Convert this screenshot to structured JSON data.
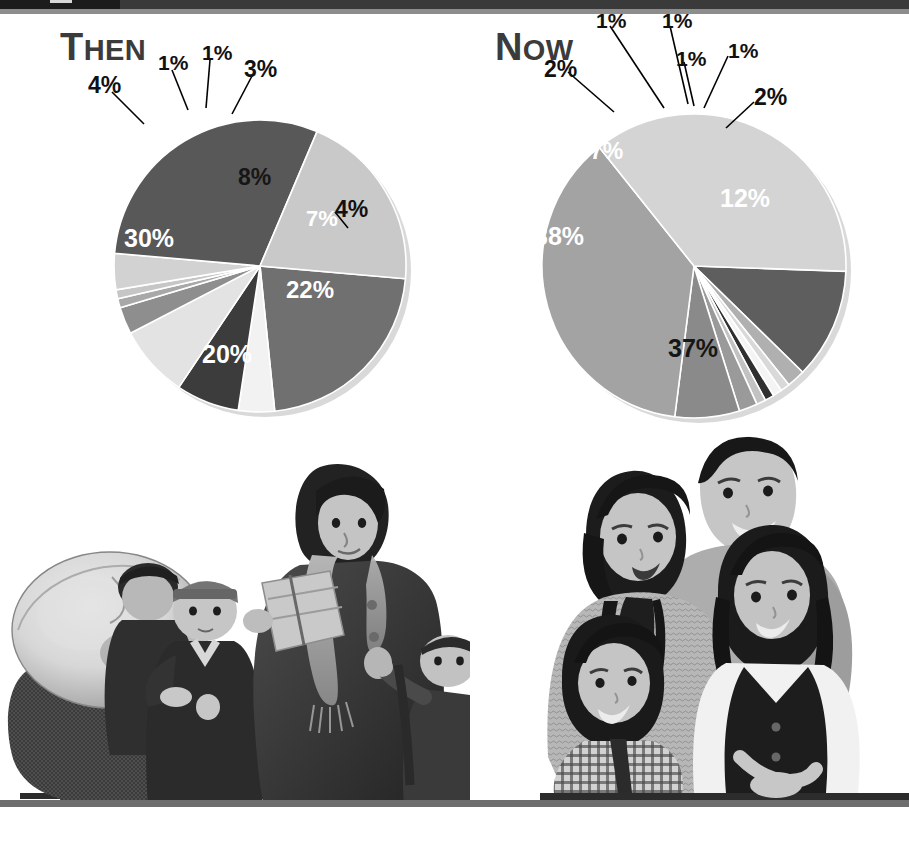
{
  "header": {
    "bar_color": "#3a3a3a",
    "tab_color": "#1c1c1c",
    "rule_color": "#8d8d8d"
  },
  "charts": [
    {
      "id": "then",
      "title_initial": "T",
      "title_rest": "HEN",
      "title_full": "Then"
    },
    {
      "id": "now",
      "title_initial": "N",
      "title_rest": "OW",
      "title_full": "Now"
    }
  ],
  "photos": {
    "left_caption": "historical-immigrant-family-photo",
    "right_caption": "modern-family-photo"
  },
  "chart_data": [
    {
      "type": "pie",
      "title": "Then",
      "id": "then",
      "categories": [
        "22%",
        "4%",
        "7%",
        "8%",
        "3%",
        "1%",
        "1%",
        "4%",
        "30%",
        "20%"
      ],
      "labels": [
        "22%",
        "4%",
        "7%",
        "8%",
        "3%",
        "1%",
        "1%",
        "4%",
        "30%",
        "20%"
      ],
      "values": [
        22,
        4,
        7,
        8,
        3,
        1,
        1,
        4,
        30,
        20
      ],
      "colors": [
        "#707070",
        "#f2f2f2",
        "#3c3c3c",
        "#e3e3e3",
        "#8e8e8e",
        "#a8a8a8",
        "#c6c6c6",
        "#d2d2d2",
        "#585858",
        "#c9c9c9"
      ],
      "label_placement": [
        "inside",
        "outside",
        "inside",
        "inside",
        "outside",
        "outside",
        "outside",
        "outside",
        "inside",
        "inside"
      ],
      "legend": "none",
      "grid": false
    },
    {
      "type": "pie",
      "title": "Now",
      "id": "now",
      "categories": [
        "12%",
        "2%",
        "1%",
        "1%",
        "1%",
        "1%",
        "2%",
        "7%",
        "38%",
        "37%"
      ],
      "labels": [
        "12%",
        "2%",
        "1%",
        "1%",
        "1%",
        "1%",
        "2%",
        "7%",
        "38%",
        "37%"
      ],
      "values": [
        12,
        2,
        1,
        1,
        1,
        1,
        2,
        7,
        38,
        37
      ],
      "colors": [
        "#5e5e5e",
        "#b0b0b0",
        "#d9d9d9",
        "#f4f4f4",
        "#2f2f2f",
        "#c2c2c2",
        "#9a9a9a",
        "#8a8a8a",
        "#a3a3a3",
        "#d4d4d4"
      ],
      "label_placement": [
        "inside",
        "outside",
        "outside",
        "outside",
        "outside",
        "outside",
        "outside",
        "inside",
        "inside",
        "inside"
      ],
      "legend": "none",
      "grid": false
    }
  ]
}
